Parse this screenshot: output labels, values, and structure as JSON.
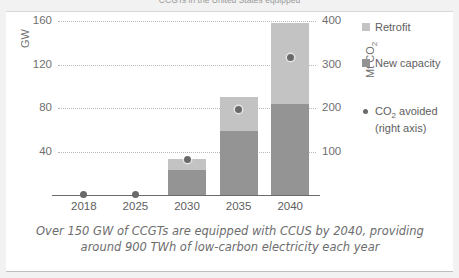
{
  "title_clipped": "CCGTs in the United States equipped",
  "caption": {
    "line1": "Over 150 GW of CCGTs are equipped with CCUS by 2040, providing",
    "line2": "around 900 TWh of low-carbon electricity each year"
  },
  "legend": {
    "items": [
      {
        "label": "Retrofit",
        "type": "swatch",
        "color": "#c3c3c3"
      },
      {
        "label": "New capacity",
        "type": "swatch",
        "color": "#949494"
      },
      {
        "label": "CO₂ avoided",
        "label2": "(right axis)",
        "type": "dot",
        "color": "#6a6a6a"
      }
    ]
  },
  "colors": {
    "retrofit": "#c3c3c3",
    "new_capacity": "#949494",
    "marker": "#6a6a6a",
    "gridline": "#b9b9b9",
    "axis": "#6b6b6b",
    "text": "#6f6f6f",
    "panel": "#ffffff",
    "page": "#f2f2f2"
  },
  "chart_data": {
    "type": "bar",
    "title": "",
    "categories": [
      "2018",
      "2025",
      "2030",
      "2035",
      "2040"
    ],
    "series": [
      {
        "name": "New capacity",
        "axis": "left",
        "values": [
          0,
          0,
          23,
          59,
          84
        ]
      },
      {
        "name": "Retrofit",
        "axis": "left",
        "values": [
          0,
          0,
          10,
          31,
          74
        ]
      },
      {
        "name": "CO₂ avoided",
        "axis": "right",
        "type": "scatter",
        "values": [
          1,
          2,
          81,
          196,
          315
        ]
      }
    ],
    "totals_gw": [
      0,
      0,
      33,
      90,
      158
    ],
    "stacked": true,
    "xlabel": "",
    "ylabel": "GW",
    "ylabel_right": "Mt CO₂",
    "ylim": [
      0,
      160
    ],
    "ylim_right": [
      0,
      400
    ],
    "yticks": [
      40,
      80,
      120,
      160
    ],
    "yticks_right": [
      100,
      200,
      300,
      400
    ],
    "grid": true,
    "legend_position": "right"
  }
}
